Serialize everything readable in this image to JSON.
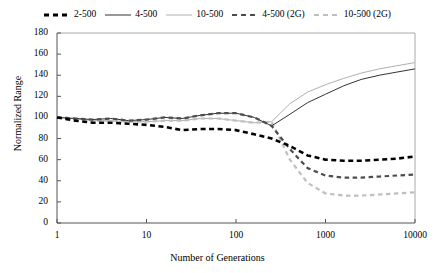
{
  "chart_data": {
    "type": "line",
    "title": "",
    "xlabel": "Number of Generations",
    "ylabel": "Normalized Range",
    "xscale": "log",
    "xlim": [
      1,
      10000
    ],
    "ylim": [
      0,
      180
    ],
    "ytick_labels": [
      "0",
      "20",
      "40",
      "60",
      "80",
      "100",
      "120",
      "140",
      "160",
      "180"
    ],
    "ytick_values": [
      0,
      20,
      40,
      60,
      80,
      100,
      120,
      140,
      160,
      180
    ],
    "xtick_labels": [
      "1",
      "10",
      "100",
      "1000",
      "10000"
    ],
    "xtick_values": [
      1,
      10,
      100,
      1000,
      10000
    ],
    "grid": false,
    "legend_position": "top-center",
    "series": [
      {
        "name": "2-500",
        "color": "#000000",
        "style": "dashed",
        "width": 2.6,
        "dash": "5,3.5",
        "x": [
          1,
          1.6,
          2.5,
          4,
          6.3,
          10,
          16,
          25,
          40,
          63,
          100,
          160,
          250,
          400,
          630,
          1000,
          1600,
          2500,
          4000,
          6300,
          10000
        ],
        "y": [
          100,
          97,
          95,
          95,
          94,
          93,
          91,
          88,
          89,
          89,
          88,
          84,
          80,
          73,
          64,
          60,
          59,
          59,
          60,
          61,
          63
        ]
      },
      {
        "name": "4-500",
        "color": "#333333",
        "style": "solid",
        "width": 1.0,
        "dash": "",
        "x": [
          1,
          1.6,
          2.5,
          4,
          6.3,
          10,
          16,
          25,
          40,
          63,
          100,
          160,
          250,
          400,
          630,
          1000,
          1600,
          2500,
          4000,
          6300,
          10000
        ],
        "y": [
          100,
          99,
          98,
          99,
          97,
          98,
          100,
          99,
          102,
          104,
          104,
          100,
          92,
          103,
          114,
          122,
          130,
          136,
          140,
          143,
          146
        ]
      },
      {
        "name": "10-500",
        "color": "#b0b0b0",
        "style": "solid",
        "width": 1.0,
        "dash": "",
        "x": [
          1,
          1.6,
          2.5,
          4,
          6.3,
          10,
          16,
          25,
          40,
          63,
          100,
          160,
          250,
          400,
          630,
          1000,
          1600,
          2500,
          4000,
          6300,
          10000
        ],
        "y": [
          100,
          99,
          97,
          97,
          96,
          96,
          97,
          97,
          99,
          99,
          97,
          95,
          96,
          113,
          124,
          131,
          137,
          142,
          146,
          149,
          152
        ]
      },
      {
        "name": "4-500 (2G)",
        "color": "#4d4d4d",
        "style": "dashed",
        "width": 2.2,
        "dash": "4.5,3.5",
        "x": [
          1,
          1.6,
          2.5,
          4,
          6.3,
          10,
          16,
          25,
          40,
          63,
          100,
          160,
          250,
          400,
          630,
          1000,
          1600,
          2500,
          4000,
          6300,
          10000
        ],
        "y": [
          100,
          99,
          98,
          99,
          97,
          98,
          100,
          99,
          102,
          104,
          104,
          100,
          92,
          70,
          52,
          45,
          43,
          43,
          44,
          45,
          46
        ]
      },
      {
        "name": "10-500 (2G)",
        "color": "#bfbfbf",
        "style": "dashed",
        "width": 2.2,
        "dash": "4.5,3.5",
        "x": [
          1,
          1.6,
          2.5,
          4,
          6.3,
          10,
          16,
          25,
          40,
          63,
          100,
          160,
          250,
          400,
          630,
          1000,
          1600,
          2500,
          4000,
          6300,
          10000
        ],
        "y": [
          100,
          99,
          97,
          97,
          96,
          96,
          97,
          97,
          99,
          99,
          97,
          95,
          96,
          60,
          38,
          28,
          26,
          26,
          27,
          28,
          29
        ]
      }
    ]
  },
  "axes": {
    "x_title": "Number of Generations",
    "y_title": "Normalized Range"
  },
  "legend": {
    "items": [
      {
        "label": "2-500"
      },
      {
        "label": "4-500"
      },
      {
        "label": "10-500"
      },
      {
        "label": "4-500 (2G)"
      },
      {
        "label": "10-500 (2G)"
      }
    ]
  }
}
